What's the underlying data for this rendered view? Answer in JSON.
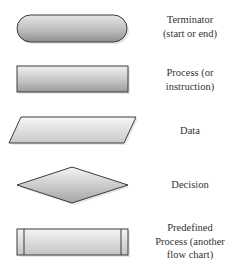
{
  "diagram": {
    "symbols": [
      {
        "name": "terminator",
        "shape": "rounded-rectangle",
        "label_lines": [
          "Terminator",
          "(start or end)"
        ]
      },
      {
        "name": "process",
        "shape": "rectangle",
        "label_lines": [
          "Process (or",
          "instruction)"
        ]
      },
      {
        "name": "data",
        "shape": "parallelogram",
        "label_lines": [
          "Data"
        ]
      },
      {
        "name": "decision",
        "shape": "diamond",
        "label_lines": [
          "Decision"
        ]
      },
      {
        "name": "predefined-process",
        "shape": "rectangle-with-side-bars",
        "label_lines": [
          "Predefined",
          "Process (another",
          "flow chart)"
        ]
      }
    ]
  },
  "colors": {
    "stroke": "#3a3a3a",
    "fill_light": "#f2f2f2",
    "fill_dark": "#9a9a9a",
    "shadow": "#cfcfcf",
    "text": "#333333"
  }
}
